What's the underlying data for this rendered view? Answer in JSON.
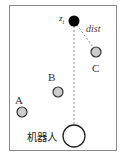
{
  "diagram": {
    "frame": {
      "x": 9,
      "y": 5,
      "width": 108,
      "height": 146,
      "stroke": "#888888"
    },
    "goal": {
      "label": "z",
      "subscript": "t",
      "cx": 74,
      "cy": 21,
      "r": 5,
      "fill": "#000000"
    },
    "robot": {
      "label": "机器人",
      "cx": 74,
      "cy": 136,
      "r": 11,
      "fill": "#ffffff",
      "stroke": "#222222"
    },
    "landmarks": [
      {
        "label": "A",
        "cx": 22,
        "cy": 112,
        "r": 5,
        "fill": "#cccccc"
      },
      {
        "label": "B",
        "cx": 58,
        "cy": 92,
        "r": 5,
        "fill": "#cccccc"
      },
      {
        "label": "C",
        "cx": 96,
        "cy": 52,
        "r": 5,
        "fill": "#cccccc"
      }
    ],
    "distance_label": "dist",
    "dashed_color": "#888888"
  }
}
